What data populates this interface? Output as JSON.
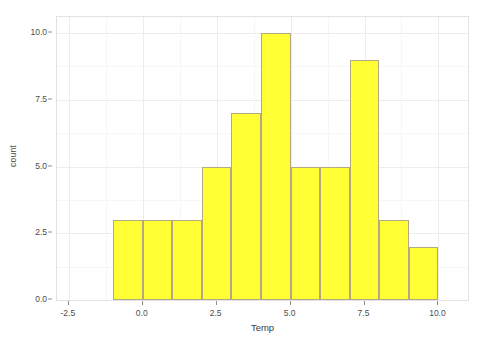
{
  "chart_data": {
    "type": "bar",
    "title": "",
    "subtitle": "",
    "xlabel": "Temp",
    "ylabel": "count",
    "xlim": [
      -2.9,
      11.0
    ],
    "ylim": [
      0,
      10.6
    ],
    "grid": true,
    "legend": null,
    "legend_position": "none",
    "bin_width": 1,
    "bin_edges": [
      -1,
      0,
      1,
      2,
      3,
      4,
      5,
      6,
      7,
      8,
      9,
      10
    ],
    "bin_centers": [
      -0.5,
      0.5,
      1.5,
      2.5,
      3.5,
      4.5,
      5.5,
      6.5,
      7.5,
      8.5,
      9.5
    ],
    "categories": [
      "-1 to 0",
      "0 to 1",
      "1 to 2",
      "2 to 3",
      "3 to 4",
      "4 to 5",
      "5 to 6",
      "6 to 7",
      "7 to 8",
      "8 to 9",
      "9 to 10"
    ],
    "values": [
      3,
      3,
      3,
      5,
      7,
      10,
      5,
      5,
      9,
      3,
      2
    ],
    "x_ticks": [
      -2.5,
      0.0,
      2.5,
      5.0,
      7.5,
      10.0
    ],
    "x_tick_labels": [
      "-2.5",
      "0.0",
      "2.5",
      "5.0",
      "7.5",
      "10.0"
    ],
    "y_ticks": [
      0.0,
      2.5,
      5.0,
      7.5,
      10.0
    ],
    "y_tick_labels": [
      "0.0",
      "2.5",
      "5.0",
      "7.5",
      "10.0"
    ],
    "x_minor_ticks": [
      -1.25,
      1.25,
      3.75,
      6.25,
      8.75
    ],
    "y_minor_ticks": [
      1.25,
      3.75,
      6.25,
      8.75
    ],
    "bar_fill_color": "#ffff33",
    "bar_border_color": "#b3a882",
    "panel_background": "#ffffff",
    "gridline_color": "#ececed",
    "minor_gridline_color": "#f6f6f7",
    "axis_text_color": "#4d4d4d",
    "total_count": 55
  },
  "artifacts": {
    "bottom_strip": "              "
  }
}
